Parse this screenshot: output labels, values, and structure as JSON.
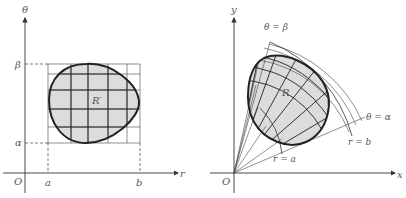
{
  "left_panel": {
    "vertical_axis_label": "θ",
    "horizontal_axis_label": "r",
    "origin_label": "O",
    "r_lower_label": "a",
    "r_upper_label": "b",
    "theta_lower_label": "α",
    "theta_upper_label": "β",
    "region_label": "R′"
  },
  "right_panel": {
    "vertical_axis_label": "y",
    "horizontal_axis_label": "x",
    "origin_label": "O",
    "ray_upper_label": "θ = β",
    "ray_lower_label": "θ = α",
    "arc_inner_label": "r = a",
    "arc_outer_label": "r = b",
    "region_label": "R"
  },
  "colors": {
    "stroke": "#222222",
    "grid": "#333333",
    "fill": "#dcdcdc",
    "text": "#555555"
  }
}
